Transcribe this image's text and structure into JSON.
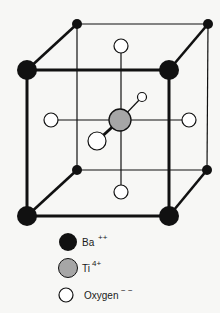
{
  "colors": {
    "background": "#f7f7f5",
    "edge": "#111111",
    "ba_fill": "#111111",
    "ti_fill": "#a6a6a6",
    "oxygen_fill": "#ffffff"
  },
  "legend": {
    "items": [
      {
        "symbol": "Ba",
        "charge": "++",
        "fill": "#111111"
      },
      {
        "symbol": "Ti",
        "charge": "4+",
        "fill": "#a6a6a6"
      },
      {
        "symbol": "Oxygen",
        "charge": "− −",
        "fill": "#ffffff"
      }
    ]
  },
  "atoms": {
    "ba_front": [
      [
        27,
        70
      ],
      [
        169,
        70
      ],
      [
        27,
        216
      ],
      [
        169,
        216
      ]
    ],
    "ba_back": [
      [
        77,
        24
      ],
      [
        208,
        24
      ],
      [
        77,
        170
      ],
      [
        207,
        170
      ]
    ],
    "ti": [
      120,
      120
    ],
    "oxygen": {
      "top": [
        121,
        46
      ],
      "bottom": [
        121,
        192
      ],
      "left": [
        51,
        120
      ],
      "right": [
        189,
        120
      ],
      "front": [
        97,
        141
      ],
      "back": [
        142,
        97
      ]
    }
  }
}
